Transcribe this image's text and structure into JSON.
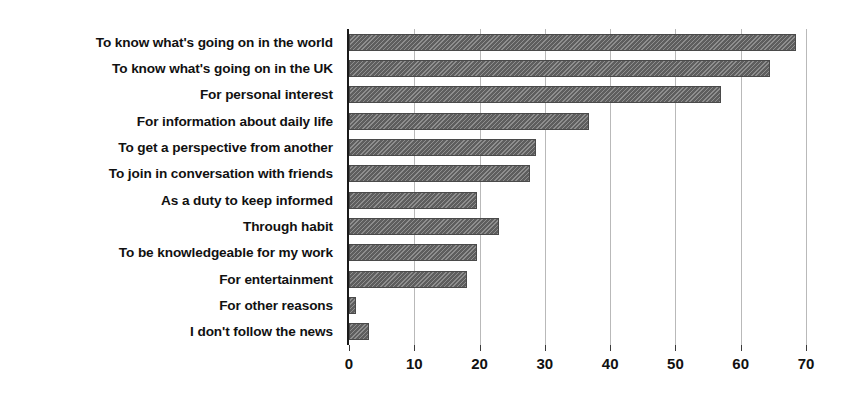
{
  "chart_data": {
    "type": "bar",
    "orientation": "horizontal",
    "title": "",
    "xlabel": "",
    "ylabel": "",
    "xlim": [
      0,
      70
    ],
    "xticks": [
      0,
      10,
      20,
      30,
      40,
      50,
      60,
      70
    ],
    "grid": true,
    "legend": "none",
    "bar_color": "#5e5e5e",
    "bar_pattern": "diagonal-hatch",
    "categories": [
      "To know what's going on in the world",
      "To know what's going on in the UK",
      "For personal interest",
      "For information about daily life",
      "To get a perspective from another",
      "To join in conversation with friends",
      "As a duty to keep informed",
      "Through habit",
      "To be knowledgeable for my work",
      "For entertainment",
      "For other reasons",
      "I don't follow the news"
    ],
    "values": [
      68.5,
      64.5,
      57,
      36.7,
      28.7,
      27.8,
      19.6,
      23,
      19.6,
      18,
      1,
      3
    ]
  }
}
